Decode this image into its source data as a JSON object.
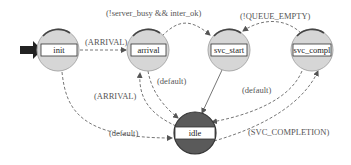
{
  "diagram": {
    "type": "state-machine",
    "colors": {
      "state_fill": "#d6d6d6",
      "state_stroke": "#888888",
      "idle_fill": "#5a5a5a",
      "edge": "#666666",
      "initial_arrow": "#222222",
      "label_box": "#ffffff"
    },
    "states": [
      {
        "id": "init",
        "label": "init"
      },
      {
        "id": "arrival",
        "label": "arrival"
      },
      {
        "id": "svc_start",
        "label": "svc_start"
      },
      {
        "id": "svc_compl",
        "label": "svc_compl"
      },
      {
        "id": "idle",
        "label": "idle"
      }
    ],
    "transitions": [
      {
        "from": "init",
        "to": "arrival",
        "label": "(ARRIVAL)"
      },
      {
        "from": "arrival",
        "to": "svc_start",
        "label": "(!server_busy && inter_ok)"
      },
      {
        "from": "svc_compl",
        "to": "svc_start",
        "label": "(!QUEUE_EMPTY)"
      },
      {
        "from": "arrival",
        "to": "idle",
        "label": "(default)"
      },
      {
        "from": "idle",
        "to": "arrival",
        "label": "(ARRIVAL)"
      },
      {
        "from": "init",
        "to": "idle",
        "label": "(default)"
      },
      {
        "from": "svc_start",
        "to": "idle",
        "label": ""
      },
      {
        "from": "svc_compl",
        "to": "idle",
        "label": "(default)"
      },
      {
        "from": "idle",
        "to": "svc_compl",
        "label": "(SVC_COMPLETION)"
      }
    ]
  }
}
